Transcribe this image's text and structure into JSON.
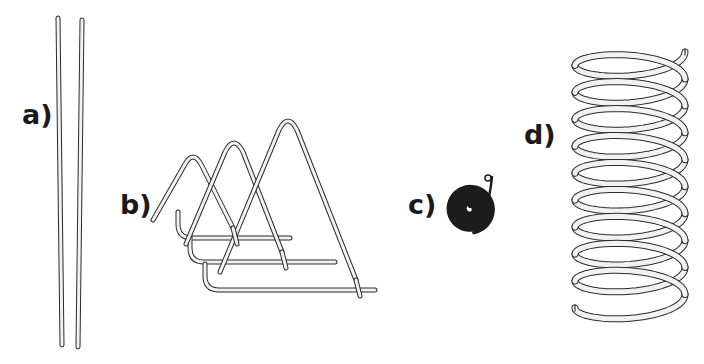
{
  "figure": {
    "background_color": "#ffffff",
    "line_color": "#2b2b2b",
    "fill_color": "#f2f2f2",
    "width": 704,
    "height": 364,
    "caption_style": "lowercase letter followed by closing parenthesis"
  },
  "panels": [
    {
      "id": "a",
      "label": "a)",
      "label_x": 22,
      "label_y": 124,
      "name": "straight-rods",
      "description": "two nearly parallel straight thin rods shown vertically",
      "element_count": 2,
      "geometry": {
        "type": "straight-rods",
        "rods": [
          {
            "x_top": 58,
            "y_top": 18,
            "x_bottom": 62,
            "y_bottom": 345,
            "thickness": 5
          },
          {
            "x_top": 82,
            "y_top": 20,
            "x_bottom": 78,
            "y_bottom": 347,
            "thickness": 5
          }
        ]
      }
    },
    {
      "id": "b",
      "label": "b)",
      "label_x": 120,
      "label_y": 214,
      "name": "zigzag-triangular-loops",
      "description": "wire bent into three nested triangular peaks of increasing size with horizontal bottom strands",
      "element_count": 3,
      "geometry": {
        "type": "zigzag-triangles",
        "thickness": 5,
        "peaks": [
          {
            "apex_x": 193,
            "apex_y": 148,
            "half_width": 40
          },
          {
            "apex_x": 234,
            "apex_y": 134,
            "half_width": 48
          },
          {
            "apex_x": 288,
            "apex_y": 112,
            "half_width": 68
          }
        ],
        "bottom_strands": [
          {
            "left_x": 178,
            "right_x": 290,
            "y": 238
          },
          {
            "left_x": 190,
            "right_x": 335,
            "y": 262
          },
          {
            "left_x": 205,
            "right_x": 375,
            "y": 290
          }
        ]
      }
    },
    {
      "id": "c",
      "label": "c)",
      "label_x": 408,
      "label_y": 214,
      "name": "flat-spiral-coil",
      "description": "tightly wound flat Archimedean spiral with a short free tail ending in a small loop at upper right",
      "element_count": 1,
      "geometry": {
        "type": "archimedean-spiral",
        "center_x": 470,
        "center_y": 209,
        "outer_radius": 24,
        "inner_radius": 2.5,
        "turns": 7.5,
        "stroke_width": 3.0,
        "tail_tip_x": 492,
        "tail_tip_y": 177
      }
    },
    {
      "id": "d",
      "label": "d)",
      "label_x": 524,
      "label_y": 144,
      "name": "helical-coil-spring",
      "description": "three dimensional helical coil spring drawn in perspective with free cut ends at top right and bottom",
      "element_count": 1,
      "geometry": {
        "type": "helix",
        "center_x": 630,
        "top_y": 52,
        "bottom_y": 308,
        "radius_x": 55,
        "radius_y": 17,
        "turns": 9.5,
        "thickness": 7
      }
    }
  ]
}
